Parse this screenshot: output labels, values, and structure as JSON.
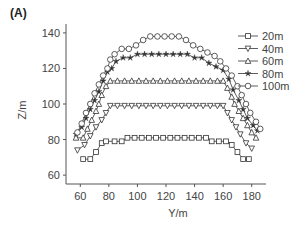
{
  "panel_label": "(A)",
  "chart_data": {
    "type": "line",
    "title": "",
    "xlabel": "Y/m",
    "ylabel": "Z/m",
    "xlim": [
      50,
      190
    ],
    "ylim": [
      55,
      145
    ],
    "xticks": [
      60,
      80,
      100,
      120,
      140,
      160,
      180
    ],
    "yticks": [
      60,
      80,
      100,
      120,
      140
    ],
    "grid": false,
    "legend_position": "upper right",
    "series": [
      {
        "name": "20m",
        "marker": "square",
        "x": [
          62,
          67,
          71,
          75,
          78,
          84,
          89,
          93,
          98,
          103,
          108,
          113,
          118,
          123,
          128,
          133,
          138,
          143,
          148,
          152,
          157,
          162,
          166,
          170,
          174,
          178
        ],
        "y": [
          69,
          69,
          73,
          78,
          79,
          79,
          79,
          81,
          81,
          81,
          81,
          81,
          81,
          81,
          81,
          81,
          81,
          81,
          81,
          79,
          79,
          79,
          77,
          73,
          69,
          69
        ]
      },
      {
        "name": "40m",
        "marker": "triangle-down",
        "x": [
          58,
          63,
          67,
          71,
          75,
          78,
          81,
          86,
          91,
          96,
          101,
          106,
          111,
          116,
          121,
          126,
          131,
          136,
          141,
          146,
          151,
          156,
          160,
          163,
          166,
          169,
          172,
          176,
          180
        ],
        "y": [
          74,
          77,
          82,
          87,
          91,
          95,
          99,
          99,
          99,
          99,
          99,
          99,
          99,
          99,
          99,
          99,
          99,
          99,
          99,
          99,
          99,
          99,
          99,
          95,
          91,
          87,
          83,
          78,
          75
        ]
      },
      {
        "name": "60m",
        "marker": "triangle-up",
        "x": [
          57,
          62,
          65,
          68,
          71,
          73,
          75,
          78,
          81,
          86,
          91,
          96,
          101,
          106,
          111,
          116,
          121,
          126,
          131,
          136,
          141,
          146,
          151,
          156,
          160,
          163,
          166,
          168,
          171,
          174,
          177,
          180,
          183
        ],
        "y": [
          81,
          81,
          86,
          91,
          96,
          100,
          105,
          110,
          113,
          113,
          113,
          113,
          113,
          113,
          113,
          113,
          113,
          113,
          113,
          113,
          113,
          113,
          113,
          113,
          113,
          109,
          104,
          100,
          96,
          92,
          88,
          84,
          81
        ]
      },
      {
        "name": "80m",
        "marker": "star",
        "x": [
          57,
          61,
          64,
          67,
          70,
          73,
          76,
          79,
          82,
          85,
          90,
          95,
          100,
          105,
          110,
          115,
          120,
          125,
          130,
          135,
          140,
          145,
          150,
          155,
          160,
          164,
          167,
          171,
          174,
          177,
          181,
          184
        ],
        "y": [
          83,
          87,
          92,
          97,
          102,
          107,
          113,
          118,
          120,
          124,
          126,
          126,
          128,
          128,
          128,
          128,
          128,
          128,
          128,
          128,
          126,
          126,
          123,
          121,
          119,
          114,
          108,
          102,
          97,
          92,
          88,
          85
        ]
      },
      {
        "name": "100m",
        "marker": "circle",
        "x": [
          58,
          61,
          64,
          67,
          70,
          73,
          76,
          79,
          81,
          84,
          89,
          94,
          99,
          104,
          109,
          114,
          119,
          124,
          129,
          134,
          139,
          144,
          149,
          154,
          158,
          162,
          166,
          170,
          173,
          176,
          179,
          183,
          186
        ],
        "y": [
          84,
          89,
          95,
          100,
          106,
          111,
          116,
          120,
          125,
          128,
          131,
          131,
          133,
          136,
          138,
          138,
          138,
          138,
          138,
          136,
          133,
          131,
          129,
          127,
          124,
          120,
          116,
          110,
          105,
          100,
          95,
          90,
          86
        ]
      }
    ]
  }
}
